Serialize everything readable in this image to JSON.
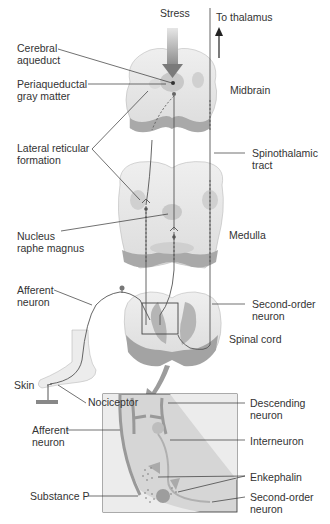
{
  "diagram": {
    "top_labels": {
      "stress": "Stress",
      "to_thalamus": "To thalamus"
    },
    "left_labels": [
      {
        "id": "cerebral-aqueduct",
        "text": "Cerebral\naqueduct"
      },
      {
        "id": "periaqueductal-gray",
        "text": "Periaqueductal\ngray matter"
      },
      {
        "id": "lateral-reticular",
        "text": "Lateral reticular\nformation"
      },
      {
        "id": "nucleus-raphe",
        "text": "Nucleus\nraphe magnus"
      },
      {
        "id": "afferent-neuron-top",
        "text": "Afferent\nneuron"
      },
      {
        "id": "skin",
        "text": "Skin"
      },
      {
        "id": "nociceptor",
        "text": "Nociceptor"
      },
      {
        "id": "afferent-neuron-inset",
        "text": "Afferent\nneuron"
      },
      {
        "id": "substance-p",
        "text": "Substance P"
      }
    ],
    "right_labels": [
      {
        "id": "midbrain",
        "text": "Midbrain"
      },
      {
        "id": "spinothalamic",
        "text": "Spinothalamic\ntract"
      },
      {
        "id": "medulla",
        "text": "Medulla"
      },
      {
        "id": "second-order-top",
        "text": "Second-order\nneuron"
      },
      {
        "id": "spinal-cord",
        "text": "Spinal cord"
      },
      {
        "id": "descending-neuron",
        "text": "Descending\nneuron"
      },
      {
        "id": "interneuron",
        "text": "Interneuron"
      },
      {
        "id": "enkephalin",
        "text": "Enkephalin"
      },
      {
        "id": "second-order-inset",
        "text": "Second-order\nneuron"
      }
    ]
  }
}
